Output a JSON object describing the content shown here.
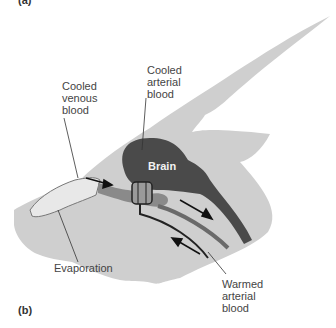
{
  "figure": {
    "panel_label_top": "(a)",
    "panel_label": "(b)",
    "labels": {
      "cooled_venous_blood": "Cooled venous blood",
      "cooled_venous_lines": [
        "Cooled",
        "venous",
        "blood"
      ],
      "cooled_arterial_lines": [
        "Cooled",
        "arterial",
        "blood"
      ],
      "brain": "Brain",
      "evaporation": "Evaporation",
      "warmed_arterial_lines": [
        "Warmed",
        "arterial",
        "blood"
      ]
    },
    "colors": {
      "head_fill": "#cfcfcf",
      "brain_fill": "#4a4a4a",
      "vein_fill": "#8a8a8a",
      "nasal_fill": "#e4e4e4",
      "artery_line": "#222222",
      "text": "#444444"
    }
  }
}
